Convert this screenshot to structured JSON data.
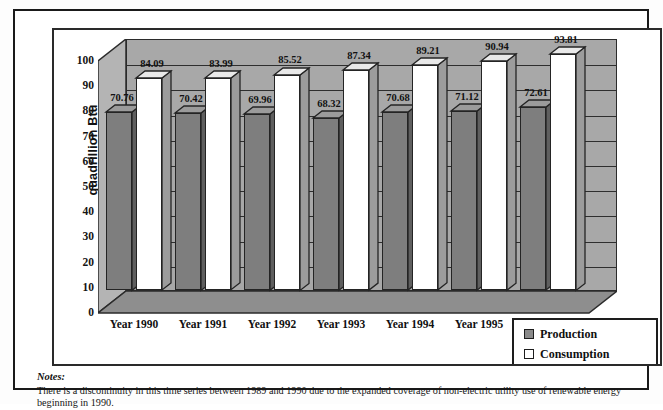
{
  "chart_data": {
    "type": "bar",
    "title": "",
    "subtitle": "",
    "xlabel": "",
    "ylabel": "quadrillion Btu",
    "ylim": [
      0,
      100
    ],
    "yticks": [
      0,
      10,
      20,
      30,
      40,
      50,
      60,
      70,
      80,
      90,
      100
    ],
    "ytick_labels": [
      "0",
      "10",
      "20",
      "30",
      "40",
      "50",
      "60",
      "70",
      "80",
      "90",
      "100"
    ],
    "categories": [
      "Year 1990",
      "Year 1991",
      "Year 1992",
      "Year 1993",
      "Year 1994",
      "Year 1995",
      "Year 1996"
    ],
    "series": [
      {
        "name": "Production",
        "color": "#7e7e7e",
        "values": [
          70.76,
          70.42,
          69.96,
          68.32,
          70.68,
          71.12,
          72.61
        ],
        "labels": [
          "70.76",
          "70.42",
          "69.96",
          "68.32",
          "70.68",
          "71.12",
          "72.61"
        ]
      },
      {
        "name": "Consumption",
        "color": "#ffffff",
        "values": [
          84.09,
          83.99,
          85.52,
          87.34,
          89.21,
          90.94,
          93.81
        ],
        "labels": [
          "84.09",
          "83.99",
          "85.52",
          "87.34",
          "89.21",
          "90.94",
          "93.81"
        ]
      }
    ],
    "grid": true,
    "grid_orientation": "horizontal",
    "legend_position": "bottom-right",
    "style": "3d-bar",
    "plot_background": "#a8a8a8"
  },
  "legend": {
    "items": [
      {
        "label": "Production",
        "swatch": "production"
      },
      {
        "label": "Consumption",
        "swatch": "consumption"
      }
    ]
  },
  "notes": {
    "title": "Notes:",
    "body": "There is a discontinuity in this time series between 1989 and 1990 due to the expanded coverage of non-electric utility use of renewable energy beginning in 1990."
  }
}
